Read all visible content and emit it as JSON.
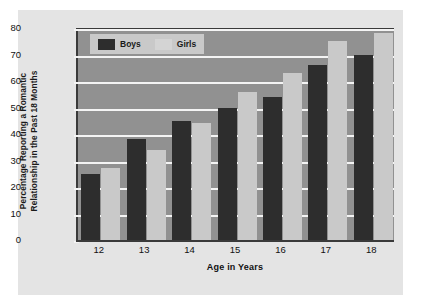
{
  "chart_data": {
    "type": "bar",
    "title": "",
    "xlabel": "Age in Years",
    "ylabel": "Percentage Reporting a Romantic Relationship in the Past 18 Months",
    "ylabel_lines": [
      "Percentage Reporting a Romantic",
      "Relationship in the Past 18 Months"
    ],
    "categories": [
      "12",
      "13",
      "14",
      "15",
      "16",
      "17",
      "18"
    ],
    "series": [
      {
        "name": "Boys",
        "values": [
          25,
          38,
          45,
          50,
          54,
          66,
          70
        ],
        "color": "#2d2d2d"
      },
      {
        "name": "Girls",
        "values": [
          27,
          34,
          44,
          56,
          63,
          75,
          78
        ],
        "color": "#c9c9c9"
      }
    ],
    "ylim": [
      0,
      80
    ],
    "ytick_values": [
      0,
      10,
      20,
      30,
      40,
      50,
      60,
      70,
      80
    ],
    "ytick_labels": [
      "0",
      "10",
      "20",
      "30",
      "40",
      "50",
      "60",
      "70",
      "80"
    ],
    "grid": true,
    "grid_color": "#f4f4f4",
    "legend_position": "top-left",
    "plot_background": "#919191",
    "panel_background": "#e4e4e4",
    "axis_color": "#3a3a3a"
  },
  "legend": {
    "entries": [
      {
        "label": "Boys"
      },
      {
        "label": "Girls"
      }
    ]
  }
}
